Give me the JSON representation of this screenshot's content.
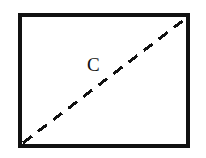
{
  "figure": {
    "type": "geometric-diagram",
    "background_color": "#ffffff",
    "ink_color": "#111111",
    "canvas": {
      "width": 206,
      "height": 158
    },
    "rectangle": {
      "name": "rectangle-outline",
      "x": 20,
      "y": 15,
      "width": 168,
      "height": 131,
      "stroke_width": 3.2,
      "stroke_color": "#111111",
      "fill": "none"
    },
    "diagonal": {
      "name": "dashed-diagonal",
      "from_corner": "bottom-left",
      "to_corner": "top-right",
      "x1": 23,
      "y1": 143,
      "x2": 185,
      "y2": 19,
      "stroke_width": 3.0,
      "stroke_color": "#111111",
      "dash_length": 11,
      "gap_length": 8
    },
    "label": {
      "name": "diagonal-label",
      "text": "C",
      "x": 87,
      "y": 55,
      "font_size_px": 19,
      "color": "#111111"
    }
  }
}
